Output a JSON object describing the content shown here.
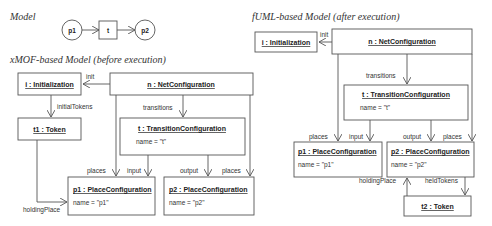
{
  "model": {
    "title": "Model",
    "nodes": {
      "p1": "p1",
      "t": "t",
      "p2": "p2"
    }
  },
  "xmof": {
    "title": "xMOF-based Model (before execution)",
    "objects": {
      "init": "i : Initialization",
      "net": "n : NetConfiguration",
      "token": "t1 : Token",
      "transition": "t : TransitionConfiguration",
      "transition_attr": "name = \"t\"",
      "p1": "p1 : PlaceConfiguration",
      "p1_attr": "name = \"p1\"",
      "p2": "p2 : PlaceConfiguration",
      "p2_attr": "name = \"p2\""
    },
    "links": {
      "init": "init",
      "initialTokens": "initialTokens",
      "transitions": "transitions",
      "places1": "places",
      "input": "input",
      "output": "output",
      "places2": "places",
      "holdingPlace": "holdingPlace"
    }
  },
  "fuml": {
    "title": "fUML-based Model (after execution)",
    "objects": {
      "init": "i : Initialization",
      "net": "n : NetConfiguration",
      "transition": "t : TransitionConfiguration",
      "transition_attr": "name = \"t\"",
      "p1": "p1 : PlaceConfiguration",
      "p1_attr": "name = \"p1\"",
      "p2": "p2 : PlaceConfiguration",
      "p2_attr": "name = \"p2\"",
      "token": "t2 : Token"
    },
    "links": {
      "init": "init",
      "transitions": "transitions",
      "places1": "places",
      "input": "input",
      "output": "output",
      "places2": "places",
      "holdingPlace": "holdingPlace",
      "heldTokens": "heldTokens"
    }
  }
}
